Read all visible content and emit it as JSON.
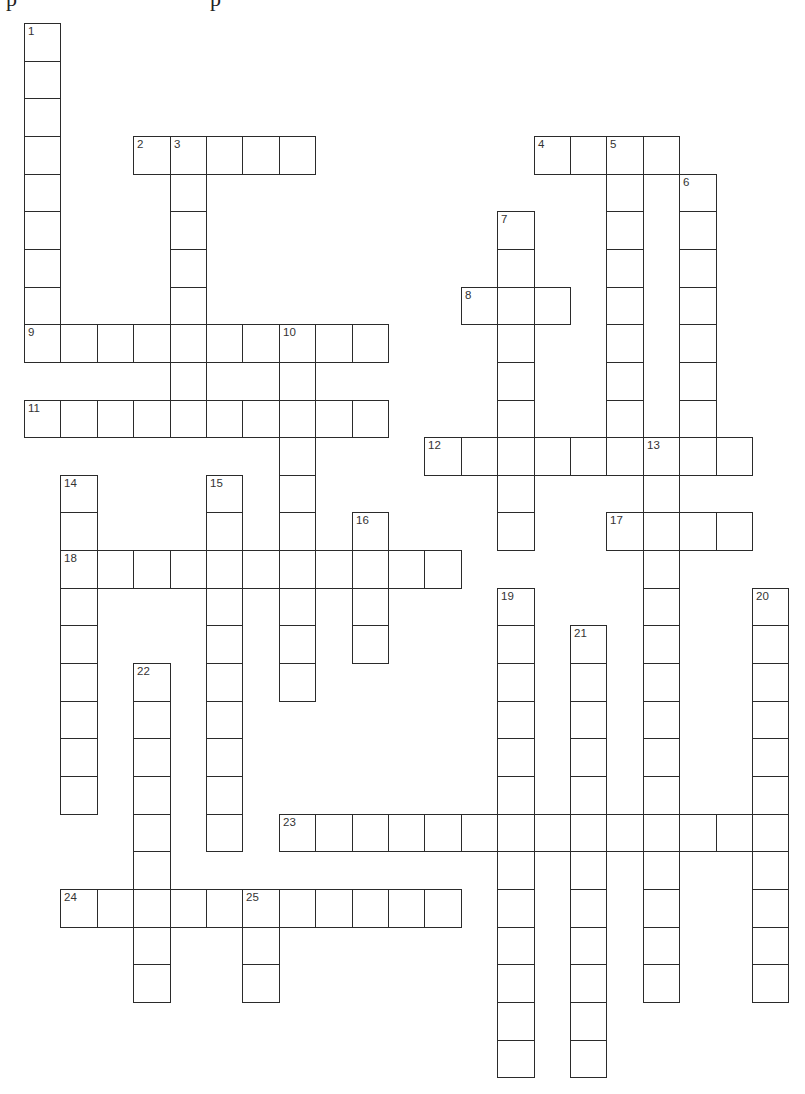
{
  "puzzle": {
    "type": "crossword",
    "grid": {
      "origin_x": 24,
      "origin_y": 23,
      "cell_width": 36.4,
      "cell_height": 37.65,
      "rows": 28,
      "cols": 21
    },
    "clipped_header_glyphs": [
      "p",
      "p"
    ],
    "words": [
      {
        "number": 1,
        "direction": "down",
        "col": 0,
        "row": 0,
        "length": 9
      },
      {
        "number": 2,
        "direction": "across",
        "col": 3,
        "row": 3,
        "length": 5
      },
      {
        "number": 3,
        "direction": "down",
        "col": 4,
        "row": 3,
        "length": 8
      },
      {
        "number": 4,
        "direction": "across",
        "col": 14,
        "row": 3,
        "length": 4
      },
      {
        "number": 5,
        "direction": "down",
        "col": 16,
        "row": 3,
        "length": 9
      },
      {
        "number": 6,
        "direction": "down",
        "col": 18,
        "row": 4,
        "length": 8
      },
      {
        "number": 7,
        "direction": "down",
        "col": 13,
        "row": 5,
        "length": 9
      },
      {
        "number": 8,
        "direction": "across",
        "col": 12,
        "row": 7,
        "length": 3
      },
      {
        "number": 9,
        "direction": "across",
        "col": 0,
        "row": 8,
        "length": 10
      },
      {
        "number": 10,
        "direction": "down",
        "col": 7,
        "row": 8,
        "length": 10
      },
      {
        "number": 11,
        "direction": "across",
        "col": 0,
        "row": 10,
        "length": 10
      },
      {
        "number": 12,
        "direction": "across",
        "col": 11,
        "row": 11,
        "length": 9
      },
      {
        "number": 13,
        "direction": "down",
        "col": 17,
        "row": 11,
        "length": 15
      },
      {
        "number": 14,
        "direction": "down",
        "col": 1,
        "row": 12,
        "length": 9
      },
      {
        "number": 15,
        "direction": "down",
        "col": 5,
        "row": 12,
        "length": 10
      },
      {
        "number": 16,
        "direction": "down",
        "col": 9,
        "row": 13,
        "length": 4
      },
      {
        "number": 17,
        "direction": "across",
        "col": 16,
        "row": 13,
        "length": 4
      },
      {
        "number": 18,
        "direction": "across",
        "col": 1,
        "row": 14,
        "length": 11
      },
      {
        "number": 19,
        "direction": "down",
        "col": 13,
        "row": 15,
        "length": 13
      },
      {
        "number": 20,
        "direction": "down",
        "col": 20,
        "row": 15,
        "length": 11
      },
      {
        "number": 21,
        "direction": "down",
        "col": 15,
        "row": 16,
        "length": 12
      },
      {
        "number": 22,
        "direction": "down",
        "col": 3,
        "row": 17,
        "length": 9
      },
      {
        "number": 23,
        "direction": "across",
        "col": 7,
        "row": 21,
        "length": 14
      },
      {
        "number": 24,
        "direction": "across",
        "col": 1,
        "row": 23,
        "length": 11
      },
      {
        "number": 25,
        "direction": "down",
        "col": 6,
        "row": 23,
        "length": 3
      }
    ],
    "colors": {
      "background": "#ffffff",
      "grid_line": "#2b2b2b",
      "number_text": "#333333"
    }
  }
}
